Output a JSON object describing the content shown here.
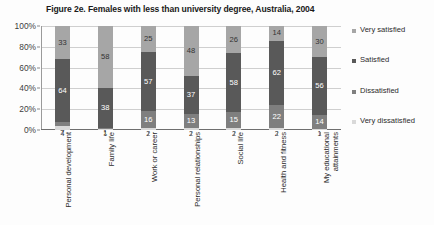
{
  "chart_data": {
    "type": "bar",
    "subtype": "stacked-bar-100-percent",
    "title": "Figure 2e. Females with less than university degree, Australia, 2004",
    "xlabel": "",
    "ylabel": "",
    "ylim": [
      0,
      100
    ],
    "ytick_labels": [
      "0%",
      "20%",
      "40%",
      "60%",
      "80%",
      "100%"
    ],
    "ytick_values": [
      0,
      20,
      40,
      60,
      80,
      100
    ],
    "grid": true,
    "legend_position": "right",
    "categories": [
      "Personal development",
      "Family life",
      "Work or career",
      "Personal relationships",
      "Social life",
      "Health and fitness",
      "My educational attainments"
    ],
    "series": [
      {
        "name": "Very satisfied",
        "color": "#a6a6a6",
        "values": [
          33,
          58,
          25,
          48,
          26,
          14,
          30
        ]
      },
      {
        "name": "Satisfied",
        "color": "#595959",
        "values": [
          64,
          38,
          57,
          37,
          58,
          62,
          56
        ]
      },
      {
        "name": "Dissatisfied",
        "color": "#7f7f7f",
        "values": [
          4,
          1,
          16,
          13,
          15,
          22,
          14
        ]
      },
      {
        "name": "Very dissatisfied",
        "color": "#d9d9d9",
        "values": [
          4,
          1,
          2,
          2,
          2,
          2,
          1
        ]
      }
    ],
    "legend_entries": [
      {
        "label": "Very satisfied",
        "color": "#a6a6a6"
      },
      {
        "label": "Satisfied",
        "color": "#595959"
      },
      {
        "label": "Dissatisfied",
        "color": "#7f7f7f"
      },
      {
        "label": "Very dissatisfied",
        "color": "#d9d9d9"
      }
    ],
    "bar_segments": [
      {
        "category": "Personal development",
        "very_satisfied": 33,
        "satisfied": 64,
        "dissatisfied": 4,
        "very_dissatisfied": 4
      },
      {
        "category": "Family life",
        "very_satisfied": 58,
        "satisfied": 38,
        "dissatisfied": 1,
        "very_dissatisfied": 1
      },
      {
        "category": "Work or career",
        "very_satisfied": 25,
        "satisfied": 57,
        "dissatisfied": 16,
        "very_dissatisfied": 2
      },
      {
        "category": "Personal relationships",
        "very_satisfied": 48,
        "satisfied": 37,
        "dissatisfied": 13,
        "very_dissatisfied": 2
      },
      {
        "category": "Social life",
        "very_satisfied": 26,
        "satisfied": 58,
        "dissatisfied": 15,
        "very_dissatisfied": 2
      },
      {
        "category": "Health and fitness",
        "very_satisfied": 14,
        "satisfied": 62,
        "dissatisfied": 22,
        "very_dissatisfied": 2
      },
      {
        "category": "My educational attainments",
        "very_satisfied": 30,
        "satisfied": 56,
        "dissatisfied": 14,
        "very_dissatisfied": 1
      }
    ]
  },
  "colors": {
    "very_satisfied": "#a6a6a6",
    "satisfied": "#595959",
    "dissatisfied": "#7f7f7f",
    "very_dissatisfied": "#d9d9d9",
    "gridline": "#cfcfcf",
    "axis": "#8a8a8a",
    "text": "#2b2b2b",
    "background": "#fdfdfd"
  }
}
